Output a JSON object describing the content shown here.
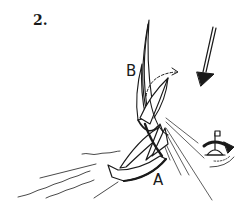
{
  "figure": {
    "number": "2.",
    "labels": {
      "boat_b": "B",
      "boat_a": "A"
    },
    "icons": {
      "wind": "wind-direction-arrow",
      "mark": "buoy-mark-with-flag",
      "rotation": "clockwise-rotation-arrow",
      "path": "dashed-course-arrow"
    },
    "colors": {
      "ink": "#1a1a1a",
      "background": "#ffffff"
    }
  }
}
